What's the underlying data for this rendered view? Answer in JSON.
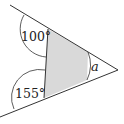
{
  "diagram": {
    "type": "geometry-angles",
    "labels": {
      "angle_top": "100°",
      "angle_bottom": "155°",
      "angle_unknown": "a"
    },
    "colors": {
      "line": "#333333",
      "shade": "#d9d9d9",
      "background": "#ffffff"
    }
  }
}
